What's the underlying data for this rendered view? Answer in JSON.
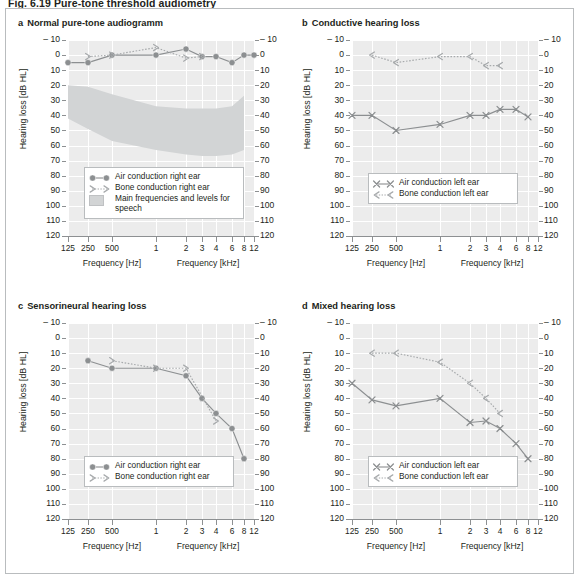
{
  "figure": {
    "heading": "Fig. 6.19  Pure-tone threshold audiometry"
  },
  "axes": {
    "ylabel": "Hearing loss [dB HL]",
    "yticks": [
      "– 10",
      "0",
      "10",
      "20",
      "30",
      "40",
      "50",
      "60",
      "70",
      "80",
      "90",
      "100",
      "110",
      "120"
    ],
    "yvalues": [
      -10,
      0,
      10,
      20,
      30,
      40,
      50,
      60,
      70,
      80,
      90,
      100,
      110,
      120
    ],
    "xticks": [
      "125",
      "250",
      "500",
      "1",
      "2",
      "3",
      "4",
      "6",
      "8",
      "12"
    ],
    "xtick_hz": [
      125,
      250,
      500,
      1000,
      2000,
      3000,
      4000,
      6000,
      8000,
      12000
    ],
    "xlabel_left": "Frequency [Hz]",
    "xlabel_right": "Frequency [kHz]"
  },
  "colors": {
    "plot_bg": "#ececec",
    "gridline": "#ffffff",
    "axis": "#8d9092",
    "curve_air": "#8c8f91",
    "curve_bone": "#a7aaac",
    "banana": "#d2d4d5",
    "frame": "#b9bcbe",
    "text": "#231f20"
  },
  "panels": [
    {
      "id": "a",
      "label": "a",
      "title": "Normal pure-tone audiogramm",
      "legend": [
        {
          "key": "circle-line",
          "text": "Air conduction right ear"
        },
        {
          "key": "bracket-right-dotted",
          "text": "Bone conduction right ear"
        },
        {
          "key": "shaded-swatch",
          "text": "Main frequencies and levels for speech"
        }
      ],
      "chart_data": {
        "type": "line",
        "title": "Normal pure-tone audiogramm",
        "xlabel": "Frequency [Hz] / Frequency [kHz]",
        "ylabel": "Hearing loss [dB HL]",
        "ylim": [
          -10,
          120
        ],
        "y_inverted": true,
        "grid": true,
        "series": [
          {
            "name": "Air conduction right ear",
            "marker": "circle",
            "line": "solid",
            "x": [
              125,
              250,
              500,
              1000,
              2000,
              3000,
              4000,
              6000,
              8000,
              12000
            ],
            "values": [
              5,
              5,
              0,
              0,
              -4,
              1,
              1,
              5,
              0,
              0
            ]
          },
          {
            "name": "Bone conduction right ear",
            "marker": "bracket-right",
            "line": "dotted",
            "x": [
              250,
              500,
              1000,
              2000,
              3000
            ],
            "values": [
              1,
              0,
              -5,
              2,
              1
            ]
          }
        ],
        "annotations": [
          {
            "name": "Main frequencies and levels for speech",
            "type": "shaded-band",
            "top_db": 20,
            "bottom_db": 65,
            "x_from": 125,
            "x_to": 8000
          }
        ]
      }
    },
    {
      "id": "b",
      "label": "b",
      "title": "Conductive hearing loss",
      "legend": [
        {
          "key": "cross-line",
          "text": "Air conduction left ear"
        },
        {
          "key": "bracket-left-dotted",
          "text": "Bone conduction left ear"
        }
      ],
      "chart_data": {
        "type": "line",
        "title": "Conductive hearing loss",
        "xlabel": "Frequency [Hz] / Frequency [kHz]",
        "ylabel": "Hearing loss [dB HL]",
        "ylim": [
          -10,
          120
        ],
        "y_inverted": true,
        "grid": true,
        "series": [
          {
            "name": "Air conduction left ear",
            "marker": "cross",
            "line": "solid",
            "x": [
              125,
              250,
              500,
              1000,
              2000,
              3000,
              4000,
              6000,
              8000
            ],
            "values": [
              40,
              40,
              50,
              46,
              40,
              40,
              36,
              36,
              41
            ]
          },
          {
            "name": "Bone conduction left ear",
            "marker": "bracket-left",
            "line": "dotted",
            "x": [
              250,
              500,
              1000,
              2000,
              3000,
              4000
            ],
            "values": [
              0,
              5,
              1,
              1,
              7,
              7
            ]
          }
        ]
      }
    },
    {
      "id": "c",
      "label": "c",
      "title": "Sensorineural hearing loss",
      "legend": [
        {
          "key": "circle-line",
          "text": "Air conduction right ear"
        },
        {
          "key": "bracket-right-dotted",
          "text": "Bone conduction right ear"
        }
      ],
      "chart_data": {
        "type": "line",
        "title": "Sensorineural hearing loss",
        "xlabel": "Frequency [Hz] / Frequency [kHz]",
        "ylabel": "Hearing loss [dB HL]",
        "ylim": [
          -10,
          120
        ],
        "y_inverted": true,
        "grid": true,
        "series": [
          {
            "name": "Air conduction right ear",
            "marker": "circle",
            "line": "solid",
            "x": [
              250,
              500,
              1000,
              2000,
              3000,
              4000,
              6000,
              8000
            ],
            "values": [
              15,
              20,
              20,
              25,
              40,
              50,
              60,
              80
            ]
          },
          {
            "name": "Bone conduction right ear",
            "marker": "bracket-right",
            "line": "dotted",
            "x": [
              500,
              1000,
              2000,
              4000
            ],
            "values": [
              15,
              20,
              20,
              55
            ]
          }
        ]
      }
    },
    {
      "id": "d",
      "label": "d",
      "title": "Mixed hearing loss",
      "legend": [
        {
          "key": "cross-line",
          "text": "Air conduction left ear"
        },
        {
          "key": "bracket-left-dotted",
          "text": "Bone conduction left ear"
        }
      ],
      "chart_data": {
        "type": "line",
        "title": "Mixed hearing loss",
        "xlabel": "Frequency [Hz] / Frequency [kHz]",
        "ylabel": "Hearing loss [dB HL]",
        "ylim": [
          -10,
          120
        ],
        "y_inverted": true,
        "grid": true,
        "series": [
          {
            "name": "Air conduction left ear",
            "marker": "cross",
            "line": "solid",
            "x": [
              125,
              250,
              500,
              1000,
              2000,
              3000,
              4000,
              6000,
              8000
            ],
            "values": [
              30,
              41,
              45,
              40,
              56,
              55,
              60,
              70,
              80
            ]
          },
          {
            "name": "Bone conduction left ear",
            "marker": "bracket-left",
            "line": "dotted",
            "x": [
              250,
              500,
              1000,
              2000,
              3000,
              4000
            ],
            "values": [
              10,
              10,
              16,
              30,
              40,
              50
            ]
          }
        ]
      }
    }
  ]
}
